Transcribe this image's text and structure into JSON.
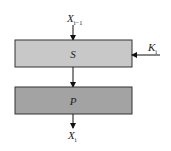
{
  "diagram": {
    "type": "SP-network round (substitution-permutation)",
    "input_label": {
      "main": "X",
      "sub": "i−1"
    },
    "output_label": {
      "main": "X",
      "sub": "i"
    },
    "key_label": {
      "main": "K",
      "sub": "i"
    },
    "blocks": [
      {
        "id": "s-box",
        "label": "S",
        "fill": "#c8c8c8"
      },
      {
        "id": "p-box",
        "label": "P",
        "fill": "#a3a3a3"
      }
    ],
    "colors": {
      "stroke": "#333333",
      "arrow": "#111111",
      "text": "#222222"
    }
  }
}
